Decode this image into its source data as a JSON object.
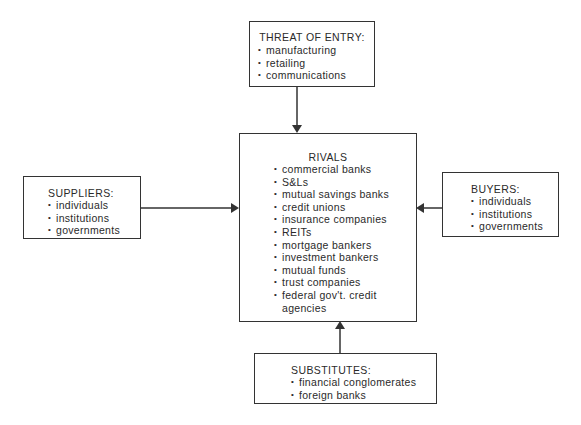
{
  "diagram": {
    "type": "five-forces",
    "threat": {
      "title": "THREAT OF ENTRY:",
      "items": [
        "manufacturing",
        "retailing",
        "communications"
      ]
    },
    "rivals": {
      "title": "RIVALS",
      "items": [
        "commercial banks",
        "S&Ls",
        "mutual savings banks",
        "credit unions",
        "insurance companies",
        "REITs",
        "mortgage bankers",
        "investment bankers",
        "mutual funds",
        "trust companies",
        "federal gov't. credit agencies"
      ]
    },
    "suppliers": {
      "title": "SUPPLIERS:",
      "items": [
        "individuals",
        "institutions",
        "governments"
      ]
    },
    "buyers": {
      "title": "BUYERS:",
      "items": [
        "individuals",
        "institutions",
        "governments"
      ]
    },
    "substitutes": {
      "title": "SUBSTITUTES:",
      "items": [
        "financial conglomerates",
        "foreign banks"
      ]
    },
    "arrows": [
      {
        "from": "threat",
        "to": "rivals"
      },
      {
        "from": "suppliers",
        "to": "rivals"
      },
      {
        "from": "buyers",
        "to": "rivals"
      },
      {
        "from": "substitutes",
        "to": "rivals"
      }
    ],
    "line_color": "#333333"
  }
}
